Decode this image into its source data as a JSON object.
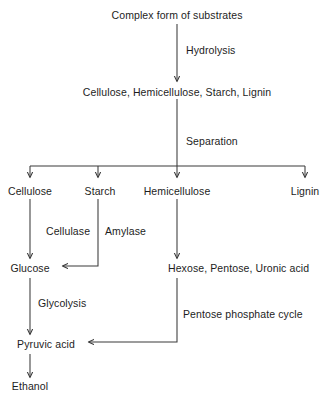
{
  "diagram": {
    "stroke_color": "#3a3a3a",
    "text_color": "#1d1d1d",
    "background_color": "#ffffff"
  },
  "nodes": {
    "substrates": "Complex form of substrates",
    "polymers": "Cellulose, Hemicellulose, Starch, Lignin",
    "cellulose": "Cellulose",
    "starch": "Starch",
    "hemicellulose": "Hemicellulose",
    "lignin": "Lignin",
    "glucose": "Glucose",
    "sugars": "Hexose, Pentose, Uronic acid",
    "pyruvic_acid": "Pyruvic acid",
    "ethanol": "Ethanol"
  },
  "edge_labels": {
    "hydrolysis": "Hydrolysis",
    "separation": "Separation",
    "cellulase": "Cellulase",
    "amylase": "Amylase",
    "glycolysis": "Glycolysis",
    "pentose_phosphate_cycle": "Pentose phosphate cycle"
  }
}
